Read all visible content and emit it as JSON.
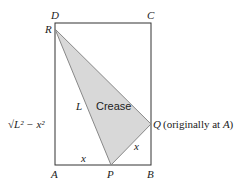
{
  "diagram": {
    "type": "geometry-fold",
    "colors": {
      "rect_stroke": "#333333",
      "triangle_fill": "#d8d8d8",
      "triangle_stroke": "#888888"
    },
    "points": {
      "D": {
        "label": "D",
        "x": 55,
        "y": 23
      },
      "C": {
        "label": "C",
        "x": 151,
        "y": 23
      },
      "R": {
        "label": "R",
        "x": 55,
        "y": 29
      },
      "A": {
        "label": "A",
        "x": 55,
        "y": 165
      },
      "P": {
        "label": "P",
        "x": 111,
        "y": 165
      },
      "B": {
        "label": "B",
        "x": 151,
        "y": 165
      },
      "Q": {
        "label": "Q",
        "x": 151,
        "y": 124
      }
    },
    "labels": {
      "L": "L",
      "crease": "Crease",
      "x_bottom": "x",
      "x_diag": "x",
      "sqrt_expr": "√L² − x²",
      "q_note": "(originally at A)"
    }
  }
}
